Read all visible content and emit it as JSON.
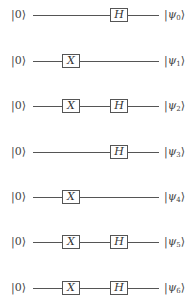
{
  "diagram": {
    "type": "quantum-circuit",
    "gate_columns": [
      {
        "name": "X",
        "x": 62
      },
      {
        "name": "H",
        "x": 110
      }
    ],
    "wire_start_x": 33,
    "wire_end_x": 159,
    "qubits": [
      {
        "input": "|0⟩",
        "output_sym": "ψ",
        "output_sub": "0",
        "y": 15,
        "gates": [
          "H"
        ]
      },
      {
        "input": "|0⟩",
        "output_sym": "ψ",
        "output_sub": "1",
        "y": 61,
        "gates": [
          "X"
        ]
      },
      {
        "input": "|0⟩",
        "output_sym": "ψ",
        "output_sub": "2",
        "y": 106,
        "gates": [
          "X",
          "H"
        ]
      },
      {
        "input": "|0⟩",
        "output_sym": "ψ",
        "output_sub": "3",
        "y": 152,
        "gates": [
          "H"
        ]
      },
      {
        "input": "|0⟩",
        "output_sym": "ψ",
        "output_sub": "4",
        "y": 197,
        "gates": [
          "X"
        ]
      },
      {
        "input": "|0⟩",
        "output_sym": "ψ",
        "output_sub": "5",
        "y": 242,
        "gates": [
          "X",
          "H"
        ]
      },
      {
        "input": "|0⟩",
        "output_sym": "ψ",
        "output_sub": "6",
        "y": 288,
        "gates": [
          "X",
          "H"
        ]
      }
    ],
    "gate_labels": {
      "X": "X",
      "H": "H"
    },
    "colors": {
      "wire": "#555555",
      "gate_border": "#555555",
      "text": "#333333",
      "background": "#ffffff"
    }
  }
}
